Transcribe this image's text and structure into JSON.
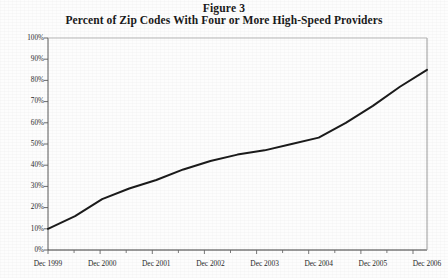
{
  "title": {
    "figure_number": "Figure 3",
    "subtitle": "Percent of Zip Codes With Four or More High-Speed Providers"
  },
  "chart_data": {
    "type": "line",
    "xlabel": "",
    "ylabel": "",
    "ylim": [
      0,
      100
    ],
    "ytick_labels": [
      "100%",
      "90%",
      "80%",
      "70%",
      "60%",
      "50%",
      "40%",
      "30%",
      "20%",
      "10%",
      "0%"
    ],
    "ytick_values": [
      100,
      90,
      80,
      70,
      60,
      50,
      40,
      30,
      20,
      10,
      0
    ],
    "xtick_labels": [
      "Dec 1999",
      "Dec 2000",
      "Dec 2001",
      "Dec 2002",
      "Dec 2003",
      "Dec 2004",
      "Dec 2005",
      "Dec 2006"
    ],
    "grid": false,
    "legend": "none",
    "line_color": "#1b1b1b",
    "x": [
      "Dec 1999",
      "Jun 2000",
      "Dec 2000",
      "Jun 2001",
      "Dec 2001",
      "Jun 2002",
      "Dec 2002",
      "Jun 2003",
      "Dec 2003",
      "Jun 2004",
      "Dec 2004",
      "Jun 2005",
      "Dec 2005",
      "Jun 2006",
      "Dec 2006"
    ],
    "values": [
      10,
      16,
      24,
      29,
      33,
      38,
      42,
      45,
      47,
      50,
      53,
      60,
      68,
      77,
      85
    ],
    "series": [
      {
        "name": "Percent of Zip Codes With Four or More High-Speed Providers",
        "values": [
          10,
          16,
          24,
          29,
          33,
          38,
          42,
          45,
          47,
          50,
          53,
          60,
          68,
          77,
          85
        ]
      }
    ],
    "annotations": []
  },
  "axis_geometry": {
    "plot_left": 48,
    "plot_right": 427,
    "plot_top": 38,
    "plot_bottom": 250
  }
}
